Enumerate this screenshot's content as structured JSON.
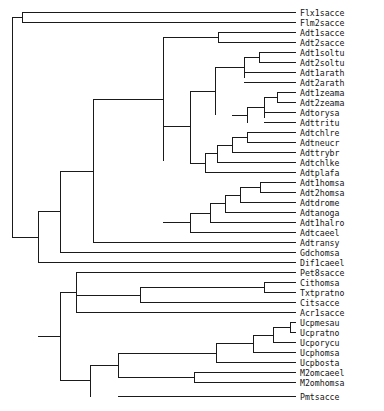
{
  "figure": {
    "type": "dendrogram",
    "orientation": "left-to-right",
    "width": 384,
    "height": 411,
    "line_color": "#1a1a1a",
    "text_color": "#141414",
    "background_color": "#ffffff"
  },
  "chart_data": {
    "type": "tree",
    "title": "",
    "xlabel": "",
    "ylabel": "",
    "grid": false,
    "legend": "none",
    "leaf_count": 37,
    "leaves": [
      {
        "index": 0,
        "label": "Flx1sacce",
        "y": 12,
        "x_branch": 22
      },
      {
        "index": 1,
        "label": "Flm2sacce",
        "y": 22,
        "x_branch": 22
      },
      {
        "index": 2,
        "label": "Adt1sacce",
        "y": 32,
        "x_branch": 218
      },
      {
        "index": 3,
        "label": "Adt2sacce",
        "y": 42,
        "x_branch": 218
      },
      {
        "index": 4,
        "label": "Adt1soltu",
        "y": 52,
        "x_branch": 259
      },
      {
        "index": 5,
        "label": "Adt2soltu",
        "y": 62,
        "x_branch": 259
      },
      {
        "index": 6,
        "label": "Adt1arath",
        "y": 72,
        "x_branch": 244
      },
      {
        "index": 7,
        "label": "Adt2arath",
        "y": 82,
        "x_branch": 244
      },
      {
        "index": 8,
        "label": "Adt1zeama",
        "y": 92,
        "x_branch": 277
      },
      {
        "index": 9,
        "label": "Adt2zeama",
        "y": 102,
        "x_branch": 277
      },
      {
        "index": 10,
        "label": "Adtorysa",
        "y": 112,
        "x_branch": 264
      },
      {
        "index": 11,
        "label": "Adttritu",
        "y": 122,
        "x_branch": 264
      },
      {
        "index": 12,
        "label": "Adtchlre",
        "y": 132,
        "x_branch": 247
      },
      {
        "index": 13,
        "label": "Adtneucr",
        "y": 142,
        "x_branch": 247
      },
      {
        "index": 14,
        "label": "Adttrybr",
        "y": 152,
        "x_branch": 232
      },
      {
        "index": 15,
        "label": "Adtchlke",
        "y": 162,
        "x_branch": 217
      },
      {
        "index": 16,
        "label": "Adtplafa",
        "y": 172,
        "x_branch": 205
      },
      {
        "index": 17,
        "label": "Adt1homsa",
        "y": 182,
        "x_branch": 260
      },
      {
        "index": 18,
        "label": "Adt2homsa",
        "y": 192,
        "x_branch": 260
      },
      {
        "index": 19,
        "label": "Adtdrome",
        "y": 202,
        "x_branch": 240
      },
      {
        "index": 20,
        "label": "Adtanoga",
        "y": 212,
        "x_branch": 225
      },
      {
        "index": 21,
        "label": "Adt1halro",
        "y": 222,
        "x_branch": 210
      },
      {
        "index": 22,
        "label": "Adtcaeel",
        "y": 232,
        "x_branch": 190
      },
      {
        "index": 23,
        "label": "Adtransy",
        "y": 242,
        "x_branch": 93
      },
      {
        "index": 24,
        "label": "Gdchomsa",
        "y": 252,
        "x_branch": 60
      },
      {
        "index": 25,
        "label": "Dif1caeel",
        "y": 262,
        "x_branch": 38
      },
      {
        "index": 26,
        "label": "Pet8sacce",
        "y": 272,
        "x_branch": 76
      },
      {
        "index": 27,
        "label": "Cithomsa",
        "y": 282,
        "x_branch": 264
      },
      {
        "index": 28,
        "label": "Txtpratno",
        "y": 292,
        "x_branch": 264
      },
      {
        "index": 29,
        "label": "Citsacce",
        "y": 302,
        "x_branch": 140
      },
      {
        "index": 30,
        "label": "Acr1sacce",
        "y": 312,
        "x_branch": 76
      },
      {
        "index": 31,
        "label": "Ucpmesau",
        "y": 322,
        "x_branch": 290
      },
      {
        "index": 32,
        "label": "Ucpratno",
        "y": 332,
        "x_branch": 290
      },
      {
        "index": 33,
        "label": "Ucporycu",
        "y": 342,
        "x_branch": 273
      },
      {
        "index": 34,
        "label": "Ucphomsa",
        "y": 352,
        "x_branch": 253
      },
      {
        "index": 35,
        "label": "Ucpbosta",
        "y": 362,
        "x_branch": 216
      },
      {
        "index": 36,
        "label": "M2omcaeel",
        "y": 372,
        "x_branch": 194
      },
      {
        "index": 37,
        "label": "M2omhomsa",
        "y": 382,
        "x_branch": 194
      },
      {
        "index": 38,
        "label": "Pmtsacce",
        "y": 396,
        "x_branch": 118
      }
    ],
    "tip_x": 296,
    "label_x": 300,
    "internal_nodes": [
      {
        "name": "n-flx-flm",
        "x": 22,
        "y_top": 12,
        "y_bottom": 22,
        "x_parent": 12
      },
      {
        "name": "n-adt-sacce",
        "x": 218,
        "y_top": 32,
        "y_bottom": 42,
        "x_parent": 163
      },
      {
        "name": "n-adt-soltu",
        "x": 259,
        "y_top": 52,
        "y_bottom": 62,
        "x_parent": 244
      },
      {
        "name": "n-adt-arath",
        "x": 244,
        "y_top": 57,
        "y_bottom": 77,
        "x_parent": 215
      },
      {
        "name": "n-adt-zeama",
        "x": 277,
        "y_top": 92,
        "y_bottom": 102,
        "x_parent": 264
      },
      {
        "name": "n-adt-orysa",
        "x": 264,
        "y_top": 97,
        "y_bottom": 117,
        "x_parent": 247
      },
      {
        "name": "n-adt-grass",
        "x": 247,
        "y_top": 107,
        "y_bottom": 122,
        "x_parent": 232
      },
      {
        "name": "n-adt-plant",
        "x": 215,
        "y_top": 67,
        "y_bottom": 114,
        "x_parent": 190
      },
      {
        "name": "n-adt-chlre",
        "x": 247,
        "y_top": 132,
        "y_bottom": 142,
        "x_parent": 232
      },
      {
        "name": "n-adt-neucr",
        "x": 232,
        "y_top": 137,
        "y_bottom": 152,
        "x_parent": 217
      },
      {
        "name": "n-adt-trybr",
        "x": 217,
        "y_top": 144,
        "y_bottom": 162,
        "x_parent": 205
      },
      {
        "name": "n-adt-chlke",
        "x": 205,
        "y_top": 153,
        "y_bottom": 172,
        "x_parent": 190
      },
      {
        "name": "n-adt-homsa",
        "x": 260,
        "y_top": 182,
        "y_bottom": 192,
        "x_parent": 240
      },
      {
        "name": "n-adt-drome",
        "x": 240,
        "y_top": 187,
        "y_bottom": 202,
        "x_parent": 225
      },
      {
        "name": "n-adt-anoga",
        "x": 225,
        "y_top": 194,
        "y_bottom": 212,
        "x_parent": 210
      },
      {
        "name": "n-adt-halro",
        "x": 210,
        "y_top": 203,
        "y_bottom": 222,
        "x_parent": 190
      },
      {
        "name": "n-adt-animal",
        "x": 190,
        "y_top": 212,
        "y_bottom": 232,
        "x_parent": 163
      },
      {
        "name": "n-adt-core",
        "x": 190,
        "y_top": 90,
        "y_bottom": 162,
        "x_parent": 163
      },
      {
        "name": "n-adt-all",
        "x": 163,
        "y_top": 37,
        "y_bottom": 160,
        "x_parent": 93
      },
      {
        "name": "n-adt-ransy",
        "x": 93,
        "y_top": 99,
        "y_bottom": 242,
        "x_parent": 60
      },
      {
        "name": "n-gdc",
        "x": 60,
        "y_top": 170,
        "y_bottom": 252,
        "x_parent": 38
      },
      {
        "name": "n-dif",
        "x": 38,
        "y_top": 211,
        "y_bottom": 262,
        "x_parent": 12
      },
      {
        "name": "n-cit-txt",
        "x": 264,
        "y_top": 282,
        "y_bottom": 292,
        "x_parent": 140
      },
      {
        "name": "n-cit-sacce",
        "x": 140,
        "y_top": 287,
        "y_bottom": 302,
        "x_parent": 76
      },
      {
        "name": "n-pet-acr",
        "x": 76,
        "y_top": 272,
        "y_bottom": 312,
        "x_parent": 60
      },
      {
        "name": "n-ucp-mesau",
        "x": 290,
        "y_top": 322,
        "y_bottom": 332,
        "x_parent": 273
      },
      {
        "name": "n-ucp-orycu",
        "x": 273,
        "y_top": 327,
        "y_bottom": 342,
        "x_parent": 253
      },
      {
        "name": "n-ucp-homsa",
        "x": 253,
        "y_top": 334,
        "y_bottom": 352,
        "x_parent": 216
      },
      {
        "name": "n-ucp-bosta",
        "x": 216,
        "y_top": 343,
        "y_bottom": 362,
        "x_parent": 118
      },
      {
        "name": "n-m2om",
        "x": 194,
        "y_top": 372,
        "y_bottom": 382,
        "x_parent": 118
      },
      {
        "name": "n-ucp-m2om",
        "x": 118,
        "y_top": 352,
        "y_bottom": 377,
        "x_parent": 90
      },
      {
        "name": "n-pmt",
        "x": 90,
        "y_top": 364,
        "y_bottom": 396,
        "x_parent": 60
      },
      {
        "name": "n-lower-clade",
        "x": 60,
        "y_top": 292,
        "y_bottom": 380,
        "x_parent": 38
      },
      {
        "name": "n-root",
        "x": 12,
        "y_top": 17,
        "y_bottom": 236,
        "x_parent": 12
      }
    ]
  }
}
